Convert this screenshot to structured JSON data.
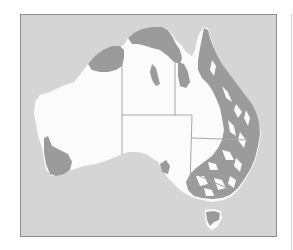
{
  "map": {
    "subject": "Australia",
    "type": "distribution map",
    "legend": [],
    "colors": {
      "ocean": "#d5d5d5",
      "land": "#fbfbfb",
      "distribution": "#9b9b9b",
      "frame_border": "#8c8c8c",
      "state_border": "#a8a8a8"
    },
    "regions": [
      "Western Australia",
      "Northern Territory",
      "South Australia",
      "Queensland",
      "New South Wales",
      "Victoria",
      "Tasmania"
    ],
    "shaded_areas": [
      "Kimberley (northern WA)",
      "Top End (northern NT)",
      "Gulf of Carpentaria coast",
      "Cape York Peninsula",
      "Eastern Queensland",
      "Eastern New South Wales",
      "Victoria",
      "South-west Western Australia",
      "Tasmania"
    ]
  }
}
